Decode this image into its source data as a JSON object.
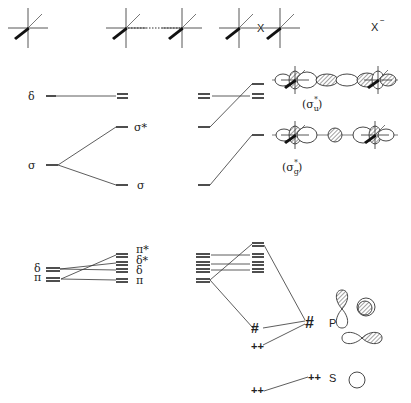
{
  "headers": {
    "fragment_x_label": "X",
    "anion_label": "X⁻",
    "anion_base": "X",
    "anion_charge": "−"
  },
  "left_column": {
    "delta_label": "δ",
    "sigma_label": "σ",
    "sigma_star_label": "σ*",
    "sigma_bonding_label": "σ",
    "delta_pi_label_delta": "δ",
    "delta_pi_label_pi": "π",
    "split_labels": [
      "π*",
      "δ*",
      "δ",
      "π"
    ]
  },
  "orbital_labels": {
    "sigma_u_star": "(σu*)",
    "sigma_g_star": "(σg*)",
    "sigma_u_base": "(σ",
    "sigma_u_sub": "u",
    "sigma_u_sup": "*",
    "sigma_g_base": "(σ",
    "sigma_g_sub": "g",
    "sigma_g_sup": "*",
    "close_paren": ")"
  },
  "halide_orbitals": {
    "p_label": "P",
    "s_label": "S",
    "p_electrons": "♯",
    "s_electrons": "++"
  }
}
